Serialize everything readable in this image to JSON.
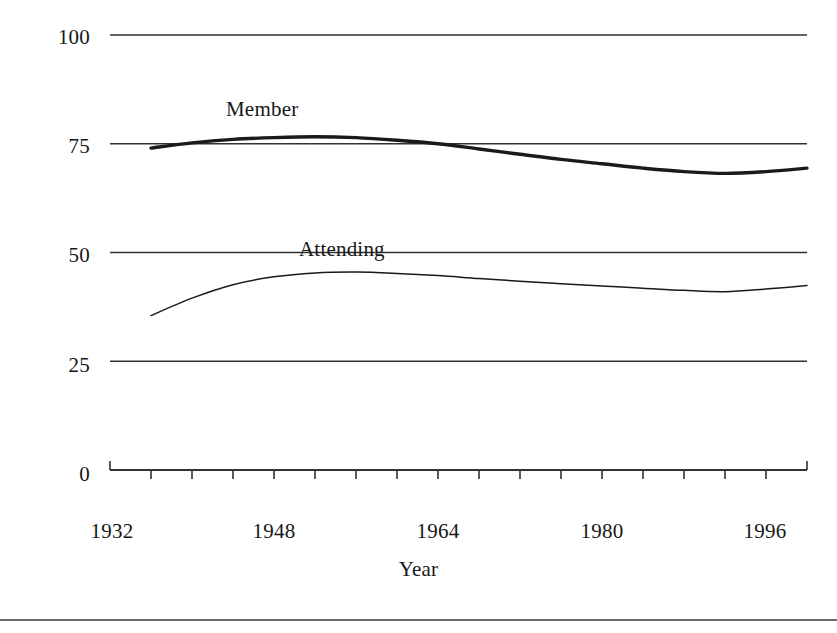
{
  "chart_data": {
    "type": "line",
    "title": "",
    "xlabel": "Year",
    "ylabel": "Percentage",
    "xlim": [
      1932,
      2000
    ],
    "ylim": [
      0,
      100
    ],
    "grid": true,
    "gridlines_y": [
      25,
      50,
      75,
      100
    ],
    "y_ticks": [
      "0",
      "25",
      "50",
      "75",
      "100"
    ],
    "y_tick_values": [
      0,
      25,
      50,
      75,
      100
    ],
    "x_ticks": [
      "1932",
      "1948",
      "1964",
      "1980",
      "1996"
    ],
    "x_tick_values": [
      1932,
      1948,
      1964,
      1980,
      1996
    ],
    "x_minor_tick_interval": 4,
    "legend_position": "inline-annotations",
    "series": [
      {
        "name": "Member",
        "style": "thick-line",
        "x": [
          1936,
          1940,
          1944,
          1948,
          1952,
          1956,
          1960,
          1964,
          1968,
          1972,
          1976,
          1980,
          1984,
          1988,
          1992,
          1996,
          2000
        ],
        "values": [
          74.0,
          75.2,
          76.0,
          76.4,
          76.6,
          76.4,
          75.8,
          75.0,
          73.8,
          72.6,
          71.4,
          70.4,
          69.4,
          68.6,
          68.2,
          68.6,
          69.4
        ]
      },
      {
        "name": "Attending",
        "style": "thin-line",
        "x": [
          1936,
          1940,
          1944,
          1948,
          1952,
          1956,
          1960,
          1964,
          1968,
          1972,
          1976,
          1980,
          1984,
          1988,
          1992,
          1996,
          2000
        ],
        "values": [
          35.5,
          39.5,
          42.6,
          44.4,
          45.3,
          45.5,
          45.2,
          44.7,
          44.0,
          43.4,
          42.8,
          42.3,
          41.8,
          41.3,
          41.0,
          41.6,
          42.4
        ]
      }
    ],
    "annotations": [
      {
        "text": "Member",
        "x": 1948,
        "y": 86
      },
      {
        "text": "Attending",
        "x": 1955,
        "y": 58
      }
    ]
  },
  "colors": {
    "line": "#1a1a1a",
    "grid": "#333333",
    "text": "#171717",
    "background": "#ffffff"
  }
}
